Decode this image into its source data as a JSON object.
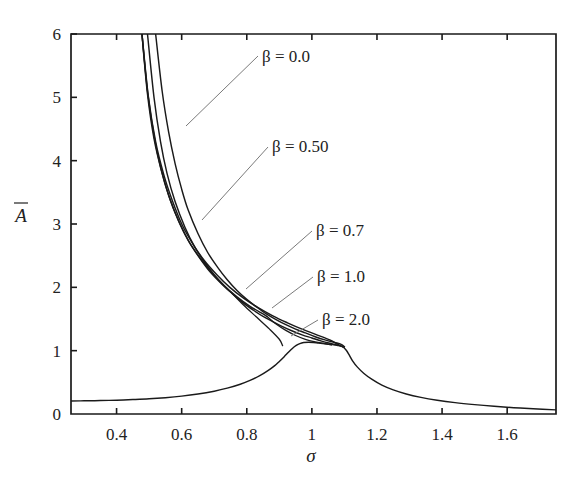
{
  "chart_data": {
    "type": "line",
    "title": "",
    "subtitle": "",
    "xlabel": "σ",
    "ylabel": "Ā",
    "xlim": [
      0.26,
      1.75
    ],
    "ylim": [
      0,
      6
    ],
    "grid": false,
    "legend_position": "inline-annotations",
    "xticks": [
      0.4,
      0.6,
      0.8,
      1.0,
      1.2,
      1.4,
      1.6
    ],
    "xticklabels": [
      "0.4",
      "0.6",
      "0.8",
      "1",
      "1.2",
      "1.4",
      "1.6"
    ],
    "yticks": [
      0,
      1,
      2,
      3,
      4,
      5,
      6
    ],
    "yticklabels": [
      "0",
      "1",
      "2",
      "3",
      "4",
      "5",
      "6"
    ],
    "annotations": [
      {
        "label": "β = 0.0",
        "x_px": 262,
        "y_px": 62,
        "leader_from": [
          258,
          56
        ],
        "leader_to": [
          186,
          126
        ]
      },
      {
        "label": "β = 0.50",
        "x_px": 272,
        "y_px": 152,
        "leader_from": [
          268,
          147
        ],
        "leader_to": [
          202,
          220
        ]
      },
      {
        "label": "β = 0.7",
        "x_px": 316,
        "y_px": 236,
        "leader_from": [
          312,
          231
        ],
        "leader_to": [
          246,
          289
        ]
      },
      {
        "label": "β = 1.0",
        "x_px": 317,
        "y_px": 282,
        "leader_from": [
          313,
          277
        ],
        "leader_to": [
          272,
          308
        ]
      },
      {
        "label": "β = 2.0",
        "x_px": 322,
        "y_px": 325,
        "leader_from": [
          318,
          320
        ],
        "leader_to": [
          291,
          336
        ]
      }
    ],
    "series": [
      {
        "name": "β = 0.0",
        "beta": 0.0,
        "comment": "upper backbone branch, rises steeply off scale near sigma=0.52",
        "points": [
          [
            0.52,
            6.0
          ],
          [
            0.54,
            5.1
          ],
          [
            0.56,
            4.45
          ],
          [
            0.58,
            3.95
          ],
          [
            0.6,
            3.55
          ],
          [
            0.62,
            3.22
          ],
          [
            0.65,
            2.85
          ],
          [
            0.68,
            2.55
          ],
          [
            0.71,
            2.32
          ],
          [
            0.74,
            2.12
          ],
          [
            0.77,
            1.95
          ],
          [
            0.8,
            1.81
          ],
          [
            0.83,
            1.69
          ],
          [
            0.86,
            1.58
          ],
          [
            0.89,
            1.49
          ],
          [
            0.92,
            1.41
          ],
          [
            0.95,
            1.34
          ],
          [
            0.98,
            1.28
          ],
          [
            1.01,
            1.22
          ],
          [
            1.04,
            1.17
          ],
          [
            1.07,
            1.13
          ],
          [
            1.09,
            1.1
          ],
          [
            1.1,
            1.06
          ]
        ]
      },
      {
        "name": "β = 0.50",
        "beta": 0.5,
        "comment": "upper branch, off scale near sigma=0.495",
        "points": [
          [
            0.495,
            6.0
          ],
          [
            0.515,
            5.0
          ],
          [
            0.535,
            4.3
          ],
          [
            0.555,
            3.8
          ],
          [
            0.58,
            3.35
          ],
          [
            0.61,
            2.95
          ],
          [
            0.64,
            2.64
          ],
          [
            0.67,
            2.4
          ],
          [
            0.7,
            2.2
          ],
          [
            0.73,
            2.03
          ],
          [
            0.76,
            1.88
          ],
          [
            0.79,
            1.75
          ],
          [
            0.82,
            1.64
          ],
          [
            0.85,
            1.54
          ],
          [
            0.88,
            1.46
          ],
          [
            0.91,
            1.38
          ],
          [
            0.94,
            1.31
          ],
          [
            0.97,
            1.25
          ],
          [
            1.0,
            1.2
          ],
          [
            1.03,
            1.15
          ],
          [
            1.06,
            1.11
          ],
          [
            1.085,
            1.08
          ],
          [
            1.1,
            1.06
          ]
        ]
      },
      {
        "name": "β = 0.7",
        "beta": 0.7,
        "comment": "upper stable branch ending in fold, plus unstable branch looping back to lower branch turning point near sigma=0.90",
        "points": [
          [
            0.478,
            6.0
          ],
          [
            0.495,
            5.1
          ],
          [
            0.515,
            4.4
          ],
          [
            0.535,
            3.9
          ],
          [
            0.56,
            3.45
          ],
          [
            0.59,
            3.05
          ],
          [
            0.62,
            2.74
          ],
          [
            0.65,
            2.5
          ],
          [
            0.68,
            2.29
          ],
          [
            0.71,
            2.12
          ],
          [
            0.74,
            1.97
          ],
          [
            0.75,
            1.93
          ]
        ],
        "unstable_points": [
          [
            0.75,
            1.93
          ],
          [
            0.79,
            1.72
          ],
          [
            0.83,
            1.53
          ],
          [
            0.87,
            1.34
          ],
          [
            0.9,
            1.18
          ],
          [
            0.91,
            1.08
          ]
        ]
      },
      {
        "name": "β = 1.0",
        "beta": 1.0,
        "comment": "upper stable branch with fold at sigma~0.86, unstable segment returning to lower branch",
        "points": [
          [
            0.478,
            6.0
          ],
          [
            0.495,
            5.05
          ],
          [
            0.515,
            4.35
          ],
          [
            0.54,
            3.8
          ],
          [
            0.565,
            3.38
          ],
          [
            0.595,
            3.0
          ],
          [
            0.625,
            2.7
          ],
          [
            0.66,
            2.44
          ],
          [
            0.695,
            2.22
          ],
          [
            0.73,
            2.03
          ],
          [
            0.77,
            1.85
          ],
          [
            0.81,
            1.7
          ],
          [
            0.85,
            1.58
          ],
          [
            0.862,
            1.54
          ]
        ],
        "unstable_points": [
          [
            0.862,
            1.54
          ],
          [
            0.89,
            1.42
          ],
          [
            0.92,
            1.32
          ],
          [
            0.95,
            1.24
          ],
          [
            0.98,
            1.18
          ],
          [
            1.01,
            1.14
          ],
          [
            1.04,
            1.11
          ],
          [
            1.06,
            1.09
          ]
        ]
      },
      {
        "name": "β = 2.0",
        "beta": 2.0,
        "comment": "upper branch merging into the main resonance peak around sigma=1.08",
        "points": [
          [
            0.478,
            6.0
          ],
          [
            0.498,
            5.0
          ],
          [
            0.52,
            4.3
          ],
          [
            0.545,
            3.78
          ],
          [
            0.572,
            3.36
          ],
          [
            0.602,
            2.98
          ],
          [
            0.635,
            2.68
          ],
          [
            0.67,
            2.42
          ],
          [
            0.708,
            2.2
          ],
          [
            0.748,
            2.0
          ],
          [
            0.79,
            1.83
          ],
          [
            0.835,
            1.68
          ],
          [
            0.88,
            1.55
          ],
          [
            0.925,
            1.44
          ],
          [
            0.97,
            1.34
          ],
          [
            1.015,
            1.25
          ],
          [
            1.055,
            1.17
          ],
          [
            1.08,
            1.1
          ],
          [
            1.095,
            1.06
          ]
        ]
      },
      {
        "name": "lower-branch",
        "beta": null,
        "comment": "single-valued lower/primary branch: flat ~0.2 at left, small shoulder peak ~1.13 near sigma=0.97, sharp drop after sigma=1.10, decaying tail to ~0.05",
        "points": [
          [
            0.26,
            0.205
          ],
          [
            0.3,
            0.208
          ],
          [
            0.35,
            0.212
          ],
          [
            0.4,
            0.218
          ],
          [
            0.45,
            0.228
          ],
          [
            0.5,
            0.24
          ],
          [
            0.55,
            0.258
          ],
          [
            0.6,
            0.282
          ],
          [
            0.65,
            0.315
          ],
          [
            0.7,
            0.36
          ],
          [
            0.74,
            0.408
          ],
          [
            0.78,
            0.47
          ],
          [
            0.81,
            0.53
          ],
          [
            0.84,
            0.605
          ],
          [
            0.865,
            0.685
          ],
          [
            0.885,
            0.76
          ],
          [
            0.9,
            0.83
          ],
          [
            0.915,
            0.905
          ],
          [
            0.928,
            0.975
          ],
          [
            0.94,
            1.035
          ],
          [
            0.952,
            1.082
          ],
          [
            0.963,
            1.112
          ],
          [
            0.975,
            1.128
          ],
          [
            0.99,
            1.132
          ],
          [
            1.005,
            1.128
          ],
          [
            1.02,
            1.12
          ],
          [
            1.04,
            1.11
          ],
          [
            1.06,
            1.098
          ],
          [
            1.08,
            1.082
          ],
          [
            1.095,
            1.06
          ],
          [
            1.105,
            1.01
          ],
          [
            1.115,
            0.93
          ],
          [
            1.125,
            0.84
          ],
          [
            1.14,
            0.74
          ],
          [
            1.16,
            0.64
          ],
          [
            1.185,
            0.545
          ],
          [
            1.215,
            0.455
          ],
          [
            1.25,
            0.38
          ],
          [
            1.29,
            0.315
          ],
          [
            1.335,
            0.262
          ],
          [
            1.385,
            0.218
          ],
          [
            1.44,
            0.18
          ],
          [
            1.5,
            0.148
          ],
          [
            1.56,
            0.122
          ],
          [
            1.62,
            0.1
          ],
          [
            1.68,
            0.082
          ],
          [
            1.75,
            0.065
          ]
        ]
      }
    ]
  },
  "figure": {
    "plot_area_px": {
      "left": 71,
      "right": 556,
      "top": 34,
      "bottom": 414
    },
    "axis_color": "#1a1a1a",
    "curve_color": "#1a1a1a",
    "leader_color": "#7a7a7a",
    "background": "#ffffff"
  }
}
